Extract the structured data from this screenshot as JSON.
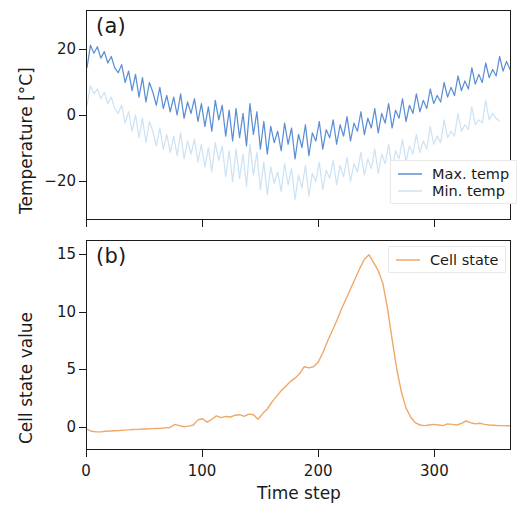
{
  "figure": {
    "xlabel": "Time step",
    "panels": [
      {
        "letter": "(a)",
        "ylabel": "Temperature [°C]"
      },
      {
        "letter": "(b)",
        "ylabel": "Cell state value"
      }
    ]
  },
  "colors": {
    "max_temp": "#5b8fd4",
    "min_temp": "#cde3f4",
    "cell_state": "#f0a868",
    "axis": "#1a1a1a",
    "grid": "#f2f2f2",
    "background": "#ffffff"
  },
  "axis_a": {
    "y_ticks": [
      "20",
      "0",
      "−20"
    ],
    "y_tick_values": [
      20,
      0,
      -20
    ],
    "ylim": [
      -32,
      32
    ],
    "legend": [
      {
        "label": "Max. temp",
        "color": "#5b8fd4",
        "style": "solid"
      },
      {
        "label": "Min. temp",
        "color": "#cde3f4",
        "style": "solid"
      }
    ]
  },
  "axis_b": {
    "y_ticks": [
      "15",
      "10",
      "5",
      "0"
    ],
    "y_tick_values": [
      15,
      10,
      5,
      0
    ],
    "ylim": [
      -2.0,
      16.2
    ],
    "legend": [
      {
        "label": "Cell state",
        "color": "#f0a868",
        "style": "solid"
      }
    ]
  },
  "axis_x": {
    "ticks": [
      "0",
      "100",
      "200",
      "300"
    ],
    "tick_values": [
      0,
      100,
      200,
      300
    ],
    "xlim": [
      0,
      366
    ]
  },
  "chart_data": [
    {
      "type": "line",
      "panel": "(a)",
      "title": "",
      "xlabel": "Time step",
      "ylabel": "Temperature [°C]",
      "xlim": [
        0,
        366
      ],
      "ylim": [
        -32,
        32
      ],
      "grid": false,
      "legend_position": "lower right",
      "x_ticks": [
        0,
        100,
        200,
        300
      ],
      "y_ticks": [
        20,
        0,
        -20
      ],
      "x": [
        0,
        3,
        6,
        9,
        12,
        15,
        18,
        21,
        24,
        27,
        30,
        33,
        36,
        39,
        42,
        45,
        48,
        51,
        54,
        57,
        60,
        63,
        66,
        69,
        72,
        75,
        78,
        81,
        84,
        87,
        90,
        93,
        96,
        99,
        102,
        105,
        108,
        111,
        114,
        117,
        120,
        123,
        126,
        129,
        132,
        135,
        138,
        141,
        144,
        147,
        150,
        153,
        156,
        159,
        162,
        165,
        168,
        171,
        174,
        177,
        180,
        183,
        186,
        189,
        192,
        195,
        198,
        201,
        204,
        207,
        210,
        213,
        216,
        219,
        222,
        225,
        228,
        231,
        234,
        237,
        240,
        243,
        246,
        249,
        252,
        255,
        258,
        261,
        264,
        267,
        270,
        273,
        276,
        279,
        282,
        285,
        288,
        291,
        294,
        297,
        300,
        303,
        306,
        309,
        312,
        315,
        318,
        321,
        324,
        327,
        330,
        333,
        336,
        339,
        342,
        345,
        348,
        351,
        354,
        357,
        360,
        363,
        366
      ],
      "series": [
        {
          "name": "Max. temp",
          "color": "#5b8fd4",
          "values": [
            14.5,
            21.5,
            19.0,
            21.0,
            17.5,
            19.5,
            16.0,
            18.0,
            14.5,
            13.0,
            15.5,
            10.0,
            13.5,
            7.5,
            12.5,
            5.5,
            11.5,
            4.0,
            10.0,
            7.0,
            3.0,
            8.5,
            2.0,
            6.0,
            1.0,
            5.5,
            0.0,
            6.5,
            -1.0,
            4.0,
            0.5,
            5.0,
            -2.0,
            3.5,
            -3.5,
            2.5,
            -5.0,
            4.5,
            -1.5,
            3.0,
            -6.5,
            1.5,
            -8.0,
            2.0,
            -7.0,
            0.5,
            -9.5,
            3.5,
            -6.0,
            1.0,
            -10.5,
            -2.0,
            -12.0,
            -3.5,
            -8.5,
            -5.0,
            -11.0,
            -2.5,
            -9.0,
            -4.0,
            -13.5,
            -6.0,
            -10.0,
            -3.0,
            -12.5,
            -5.5,
            -8.0,
            -2.0,
            -10.5,
            -4.5,
            -7.0,
            -1.5,
            -9.0,
            -3.0,
            -6.5,
            -0.5,
            -8.0,
            -2.5,
            -5.0,
            1.0,
            -6.0,
            -1.0,
            -4.0,
            2.0,
            -5.5,
            0.5,
            -2.5,
            3.5,
            -4.0,
            1.5,
            -1.0,
            5.0,
            -2.0,
            3.0,
            0.5,
            6.5,
            1.0,
            4.5,
            2.0,
            8.0,
            3.5,
            6.0,
            4.0,
            10.0,
            5.5,
            8.5,
            6.0,
            12.0,
            7.5,
            10.5,
            8.0,
            14.5,
            9.5,
            12.5,
            10.0,
            16.0,
            11.5,
            14.0,
            12.0,
            18.0,
            13.5,
            16.5,
            14.0,
            11.0
          ]
        },
        {
          "name": "Min. temp",
          "color": "#cde3f4",
          "values": [
            3.0,
            9.0,
            6.5,
            8.0,
            5.0,
            7.0,
            3.5,
            5.5,
            2.0,
            0.5,
            3.0,
            -2.5,
            1.0,
            -5.0,
            0.0,
            -7.0,
            -1.0,
            -8.5,
            -2.0,
            -5.0,
            -9.5,
            -4.0,
            -10.5,
            -6.0,
            -11.5,
            -6.5,
            -12.5,
            -5.5,
            -13.5,
            -8.0,
            -12.0,
            -7.5,
            -14.5,
            -9.0,
            -16.0,
            -10.0,
            -17.5,
            -8.5,
            -14.0,
            -9.5,
            -19.0,
            -11.0,
            -20.5,
            -10.5,
            -19.5,
            -12.0,
            -22.0,
            -9.0,
            -18.5,
            -11.5,
            -23.0,
            -14.5,
            -24.5,
            -16.0,
            -21.0,
            -17.5,
            -23.5,
            -15.0,
            -21.5,
            -16.5,
            -26.0,
            -18.5,
            -22.5,
            -15.5,
            -25.0,
            -18.0,
            -20.5,
            -14.5,
            -23.0,
            -17.0,
            -19.5,
            -14.0,
            -21.5,
            -15.5,
            -19.0,
            -13.0,
            -20.5,
            -15.0,
            -17.5,
            -11.5,
            -18.5,
            -13.5,
            -16.5,
            -10.5,
            -18.0,
            -12.0,
            -15.0,
            -9.0,
            -16.5,
            -11.0,
            -13.5,
            -7.5,
            -14.5,
            -9.5,
            -12.0,
            -6.0,
            -11.5,
            -8.0,
            -10.5,
            -3.5,
            -9.0,
            -6.5,
            -8.5,
            -1.5,
            -7.0,
            -5.0,
            -6.5,
            0.5,
            -5.0,
            -3.0,
            -4.5,
            2.5,
            -3.0,
            -1.5,
            -2.5,
            4.5,
            -1.5,
            0.5,
            -1.0,
            -2.0
          ]
        }
      ]
    },
    {
      "type": "line",
      "panel": "(b)",
      "title": "",
      "xlabel": "Time step",
      "ylabel": "Cell state value",
      "xlim": [
        0,
        366
      ],
      "ylim": [
        -2.0,
        16.2
      ],
      "grid": false,
      "legend_position": "upper right",
      "x_ticks": [
        0,
        100,
        200,
        300
      ],
      "y_ticks": [
        0,
        5,
        10,
        15
      ],
      "series": [
        {
          "name": "Cell state",
          "color": "#f0a868",
          "x": [
            0,
            4,
            8,
            12,
            16,
            20,
            24,
            28,
            32,
            36,
            40,
            44,
            48,
            52,
            56,
            60,
            64,
            68,
            72,
            76,
            80,
            84,
            88,
            92,
            96,
            100,
            104,
            108,
            112,
            116,
            120,
            124,
            128,
            132,
            136,
            140,
            144,
            148,
            152,
            156,
            160,
            164,
            168,
            172,
            176,
            180,
            184,
            188,
            192,
            196,
            200,
            204,
            208,
            212,
            216,
            220,
            224,
            228,
            232,
            236,
            240,
            244,
            248,
            252,
            256,
            260,
            264,
            268,
            272,
            276,
            280,
            284,
            288,
            292,
            296,
            300,
            304,
            308,
            312,
            316,
            320,
            324,
            328,
            332,
            336,
            340,
            344,
            348,
            352,
            356,
            360,
            364,
            366
          ],
          "values": [
            -0.25,
            -0.45,
            -0.5,
            -0.5,
            -0.45,
            -0.42,
            -0.4,
            -0.38,
            -0.35,
            -0.33,
            -0.3,
            -0.28,
            -0.25,
            -0.25,
            -0.22,
            -0.2,
            -0.18,
            -0.15,
            -0.12,
            0.15,
            0.05,
            -0.05,
            0.0,
            0.1,
            0.55,
            0.65,
            0.35,
            0.6,
            0.9,
            0.75,
            0.85,
            0.8,
            0.95,
            1.0,
            0.85,
            1.05,
            1.0,
            0.6,
            1.1,
            1.5,
            2.1,
            2.6,
            3.1,
            3.5,
            3.9,
            4.2,
            4.6,
            5.2,
            5.1,
            5.2,
            5.6,
            6.4,
            7.4,
            8.3,
            9.2,
            10.2,
            11.1,
            12.0,
            12.9,
            13.8,
            14.6,
            15.0,
            14.3,
            13.6,
            12.5,
            10.3,
            7.6,
            5.0,
            3.0,
            1.6,
            0.8,
            0.3,
            0.1,
            0.05,
            0.1,
            0.15,
            0.1,
            0.05,
            0.2,
            0.15,
            0.1,
            0.25,
            0.45,
            0.3,
            0.2,
            0.25,
            0.15,
            0.1,
            0.08,
            0.05,
            0.05,
            0.04,
            0.03
          ]
        }
      ]
    }
  ]
}
